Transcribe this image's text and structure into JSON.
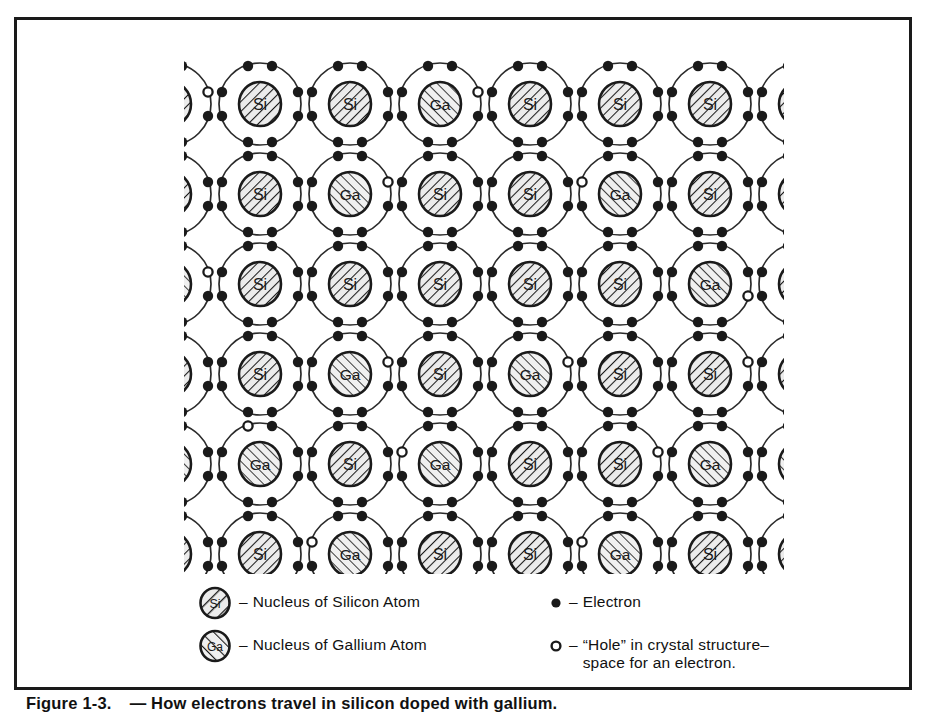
{
  "figure": {
    "caption_number": "Figure 1-3.",
    "caption_text": "— How electrons travel in silicon doped with gallium."
  },
  "legend": {
    "items": [
      {
        "symbol": "silicon-nucleus-symbol",
        "label": "Si",
        "dash": "–",
        "text": "Nucleus of Silicon Atom"
      },
      {
        "symbol": "gallium-nucleus-symbol",
        "label": "Ga",
        "dash": "–",
        "text": "Nucleus of Gallium Atom"
      },
      {
        "symbol": "electron-symbol",
        "label": "",
        "dash": "–",
        "text": "Electron"
      },
      {
        "symbol": "hole-symbol",
        "label": "",
        "dash": "–",
        "text": "“Hole” in crystal structure–\nspace for an electron."
      }
    ]
  },
  "lattice": {
    "atom_labels": {
      "silicon": "Si",
      "gallium": "Ga"
    },
    "colors": {
      "ink": "#1a1a1a",
      "shell_stroke": "#2b2b2b",
      "nucleus_fill": "#e8e8e8",
      "hatch": "#1a1a1a",
      "electron_fill": "#1a1a1a",
      "hole_fill": "#ffffff",
      "page": "#ffffff"
    },
    "geometry": {
      "cols": 6,
      "rows": 6,
      "cell_w": 90,
      "cell_h": 90,
      "origin_x": 76,
      "origin_y": 75,
      "shell_r": 41,
      "nucleus_rx": 21,
      "nucleus_ry": 22,
      "electron_r": 5.2,
      "hole_r": 4.6
    },
    "rows": [
      {
        "index": 0,
        "atoms": [
          "Si",
          "Si",
          "Ga",
          "Si",
          "Si",
          "Si"
        ]
      },
      {
        "index": 1,
        "atoms": [
          "Si",
          "Ga",
          "Si",
          "Si",
          "Ga",
          "Si"
        ]
      },
      {
        "index": 2,
        "atoms": [
          "Si",
          "Si",
          "Si",
          "Si",
          "Si",
          "Ga"
        ]
      },
      {
        "index": 3,
        "atoms": [
          "Si",
          "Ga",
          "Si",
          "Ga",
          "Si",
          "Si"
        ]
      },
      {
        "index": 4,
        "atoms": [
          "Ga",
          "Si",
          "Ga",
          "Si",
          "Si",
          "Ga"
        ]
      },
      {
        "index": 5,
        "atoms": [
          "Si",
          "Ga",
          "Si",
          "Si",
          "Ga",
          "Si"
        ]
      }
    ],
    "holes": [
      {
        "row": 0,
        "col": -1,
        "side": "right"
      },
      {
        "row": 0,
        "col": 2,
        "side": "right"
      },
      {
        "row": 1,
        "col": 1,
        "side": "right"
      },
      {
        "row": 1,
        "col": 4,
        "side": "left"
      },
      {
        "row": 2,
        "col": -1,
        "side": "right"
      },
      {
        "row": 2,
        "col": 5,
        "side": "belowright"
      },
      {
        "row": 3,
        "col": 1,
        "side": "right"
      },
      {
        "row": 3,
        "col": 3,
        "side": "right"
      },
      {
        "row": 3,
        "col": 5,
        "side": "right"
      },
      {
        "row": 4,
        "col": 0,
        "side": "aboveleft"
      },
      {
        "row": 4,
        "col": 2,
        "side": "left"
      },
      {
        "row": 4,
        "col": 4,
        "side": "right"
      },
      {
        "row": 5,
        "col": 1,
        "side": "left"
      },
      {
        "row": 5,
        "col": 4,
        "side": "left"
      }
    ],
    "counts": {
      "silicon": 24,
      "gallium": 12,
      "holes": 14
    }
  }
}
